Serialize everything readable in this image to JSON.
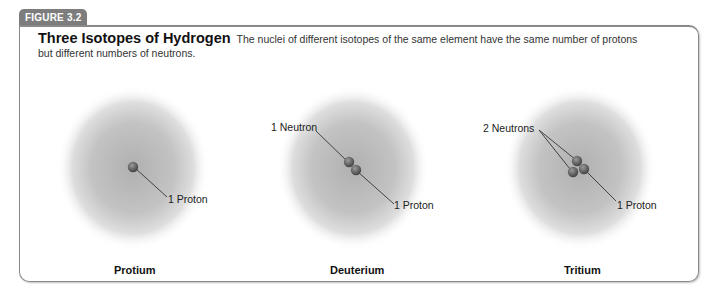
{
  "figure": {
    "tab_label": "FIGURE 3.2",
    "title": "Three Isotopes of Hydrogen",
    "description": "The nuclei of different isotopes of the same element have the same number of protons but different numbers of neutrons."
  },
  "isotopes": [
    {
      "name": "Protium",
      "protons": 1,
      "neutrons": 0,
      "proton_label": "1 Proton",
      "neutron_label": ""
    },
    {
      "name": "Deuterium",
      "protons": 1,
      "neutrons": 1,
      "proton_label": "1 Proton",
      "neutron_label": "1 Neutron"
    },
    {
      "name": "Tritium",
      "protons": 1,
      "neutrons": 2,
      "proton_label": "1 Proton",
      "neutron_label": "2 Neutrons"
    }
  ],
  "colors": {
    "tab": "#7d7d7d",
    "cloud": "#b5b5b5",
    "particle": "#6f6f6f",
    "frame": "#8a8a8a"
  }
}
